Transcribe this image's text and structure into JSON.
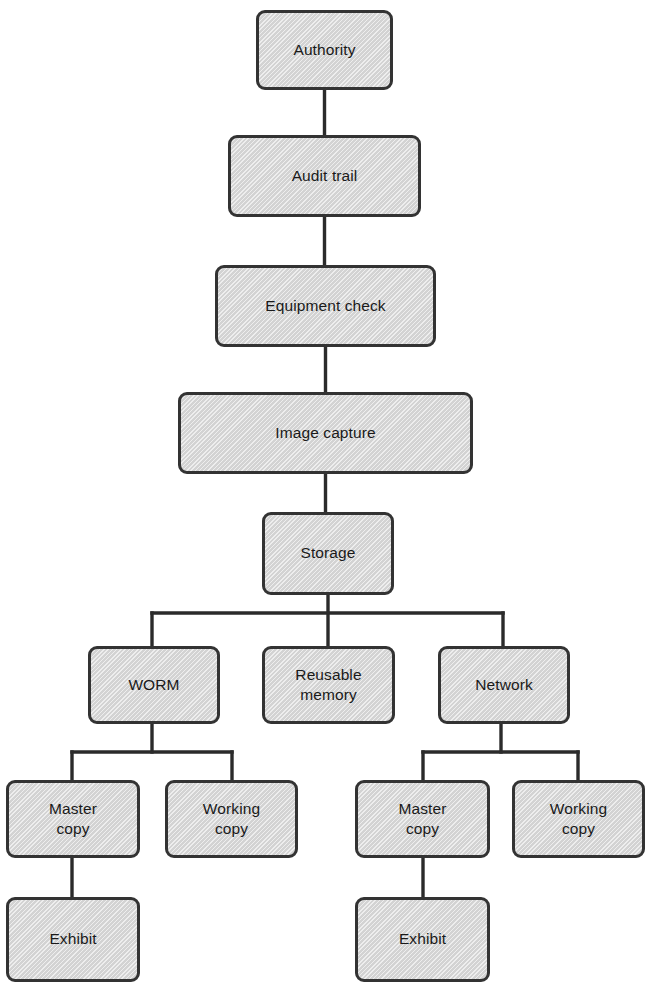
{
  "diagram": {
    "type": "flowchart",
    "title": "",
    "colors": {
      "node_fill": "#d3d3d3",
      "node_border": "#333333",
      "connector": "#2b2b2b",
      "text": "#1a1a1a",
      "background": "#ffffff"
    },
    "nodes": [
      {
        "id": "authority",
        "label": "Authority",
        "x": 256,
        "y": 10,
        "w": 137,
        "h": 80
      },
      {
        "id": "audit-trail",
        "label": "Audit trail",
        "x": 228,
        "y": 135,
        "w": 193,
        "h": 82
      },
      {
        "id": "equipment-check",
        "label": "Equipment check",
        "x": 215,
        "y": 265,
        "w": 221,
        "h": 82
      },
      {
        "id": "image-capture",
        "label": "Image capture",
        "x": 178,
        "y": 392,
        "w": 295,
        "h": 82
      },
      {
        "id": "storage",
        "label": "Storage",
        "x": 262,
        "y": 512,
        "w": 132,
        "h": 83
      },
      {
        "id": "worm",
        "label": "WORM",
        "x": 88,
        "y": 646,
        "w": 132,
        "h": 78
      },
      {
        "id": "reusable-memory",
        "label": "Reusable\nmemory",
        "x": 262,
        "y": 646,
        "w": 133,
        "h": 78
      },
      {
        "id": "network",
        "label": "Network",
        "x": 438,
        "y": 646,
        "w": 132,
        "h": 78
      },
      {
        "id": "worm-master-copy",
        "label": "Master\ncopy",
        "x": 6,
        "y": 780,
        "w": 134,
        "h": 78
      },
      {
        "id": "worm-working-copy",
        "label": "Working\ncopy",
        "x": 165,
        "y": 780,
        "w": 133,
        "h": 78
      },
      {
        "id": "network-master-copy",
        "label": "Master\ncopy",
        "x": 355,
        "y": 780,
        "w": 135,
        "h": 78
      },
      {
        "id": "network-working-copy",
        "label": "Working\ncopy",
        "x": 512,
        "y": 780,
        "w": 133,
        "h": 78
      },
      {
        "id": "worm-exhibit",
        "label": "Exhibit",
        "x": 6,
        "y": 897,
        "w": 134,
        "h": 85
      },
      {
        "id": "network-exhibit",
        "label": "Exhibit",
        "x": 355,
        "y": 897,
        "w": 135,
        "h": 85
      }
    ],
    "connectors": [
      {
        "id": "authority-to-audit-trail",
        "from": "authority",
        "to": "audit-trail",
        "points": "324.5,90 324.5,135"
      },
      {
        "id": "audit-trail-to-equipment-check",
        "from": "audit-trail",
        "to": "equipment-check",
        "points": "324.5,217 324.5,265"
      },
      {
        "id": "equipment-check-to-image-capture",
        "from": "equipment-check",
        "to": "image-capture",
        "points": "325.5,347 325.5,392"
      },
      {
        "id": "image-capture-to-storage",
        "from": "image-capture",
        "to": "storage",
        "points": "325.5,474 325.5,512"
      },
      {
        "id": "storage-to-split-bus",
        "from": "storage",
        "to": "storage-bus",
        "points": "328,595 328,646"
      },
      {
        "id": "storage-bus",
        "from": "storage",
        "to": "worm-network-bus",
        "points": "152,613 503,613"
      },
      {
        "id": "storage-bus-to-worm",
        "from": "storage-bus",
        "to": "worm",
        "points": "152,613 152,646"
      },
      {
        "id": "storage-bus-to-network",
        "from": "storage-bus",
        "to": "network",
        "points": "503,613 503,646"
      },
      {
        "id": "worm-to-split-bus",
        "from": "worm",
        "to": "worm-bus",
        "points": "152,724 152,752"
      },
      {
        "id": "worm-bus",
        "from": "worm",
        "to": "worm-children",
        "points": "72,752 232,752"
      },
      {
        "id": "worm-bus-to-master-copy",
        "from": "worm-bus",
        "to": "worm-master-copy",
        "points": "72,752 72,780"
      },
      {
        "id": "worm-bus-to-working-copy",
        "from": "worm-bus",
        "to": "worm-working-copy",
        "points": "232,752 232,780"
      },
      {
        "id": "network-to-split-bus",
        "from": "network",
        "to": "network-bus",
        "points": "501,724 501,752"
      },
      {
        "id": "network-bus",
        "from": "network",
        "to": "network-children",
        "points": "423,752 578,752"
      },
      {
        "id": "network-bus-to-master-copy",
        "from": "network-bus",
        "to": "network-master-copy",
        "points": "423,752 423,780"
      },
      {
        "id": "network-bus-to-working-copy",
        "from": "network-bus",
        "to": "network-working-copy",
        "points": "578,752 578,780"
      },
      {
        "id": "worm-master-copy-to-exhibit",
        "from": "worm-master-copy",
        "to": "worm-exhibit",
        "points": "72,858 72,897"
      },
      {
        "id": "network-master-copy-to-exhibit",
        "from": "network-master-copy",
        "to": "network-exhibit",
        "points": "423,858 423,897"
      }
    ]
  }
}
